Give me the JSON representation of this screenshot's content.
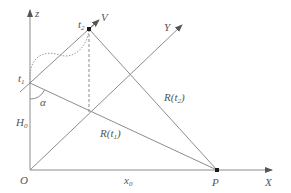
{
  "diagram": {
    "axes": {
      "z": "z",
      "x": "X",
      "y": "Y",
      "origin": "O"
    },
    "points": {
      "t1": {
        "base": "t",
        "sub": "1"
      },
      "t2": {
        "base": "t",
        "sub": "2"
      },
      "v": "V",
      "p": "P"
    },
    "labels": {
      "alpha": "α",
      "h0": {
        "base": "H",
        "sub": "0"
      },
      "x0": {
        "base": "x",
        "sub": "0"
      },
      "r_t1": {
        "pre": "R(t",
        "sub": "1",
        "post": ")"
      },
      "r_t2": {
        "pre": "R(t",
        "sub": "2",
        "post": ")"
      }
    },
    "colors": {
      "line": "#8c8c8c",
      "point": "#1a1a1a",
      "text": "#555555"
    }
  }
}
